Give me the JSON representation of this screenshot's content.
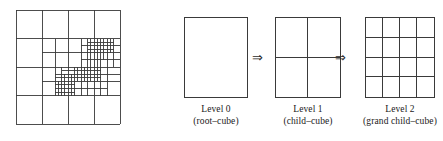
{
  "figure": {
    "name": "octree-refinement-figure",
    "background": "#ffffff",
    "line_color": "#3a3a3a",
    "text_color": "#1a1a1a"
  },
  "quadtree": {
    "name": "adaptive-quadtree-mesh",
    "label": "adaptively refined quadtree mesh",
    "domain": {
      "x0": 16,
      "y0": 10,
      "x1": 120,
      "y1": 124
    },
    "base_divisions": 4,
    "max_level": 4,
    "lines": [
      {
        "type": "h",
        "y": 10,
        "x0": 16,
        "x1": 120
      },
      {
        "type": "h",
        "y": 38.5,
        "x0": 16,
        "x1": 120
      },
      {
        "type": "h",
        "y": 67,
        "x0": 16,
        "x1": 120
      },
      {
        "type": "h",
        "y": 95.5,
        "x0": 16,
        "x1": 120
      },
      {
        "type": "h",
        "y": 124,
        "x0": 16,
        "x1": 120
      },
      {
        "type": "v",
        "x": 16,
        "y0": 10,
        "y1": 124
      },
      {
        "type": "v",
        "x": 42,
        "y0": 10,
        "y1": 124
      },
      {
        "type": "v",
        "x": 68,
        "y0": 10,
        "y1": 124
      },
      {
        "type": "v",
        "x": 94,
        "y0": 10,
        "y1": 124
      },
      {
        "type": "v",
        "x": 120,
        "y0": 10,
        "y1": 124
      },
      {
        "type": "h",
        "y": 52.75,
        "x0": 42,
        "x1": 120
      },
      {
        "type": "h",
        "y": 81.25,
        "x0": 42,
        "x1": 120
      },
      {
        "type": "v",
        "x": 55,
        "y0": 38.5,
        "y1": 95.5
      },
      {
        "type": "v",
        "x": 81,
        "y0": 38.5,
        "y1": 95.5
      },
      {
        "type": "v",
        "x": 107,
        "y0": 38.5,
        "y1": 95.5
      },
      {
        "type": "h",
        "y": 45.6,
        "x0": 81,
        "x1": 120
      },
      {
        "type": "h",
        "y": 59.9,
        "x0": 81,
        "x1": 120
      },
      {
        "type": "h",
        "y": 74.1,
        "x0": 55,
        "x1": 120
      },
      {
        "type": "h",
        "y": 88.4,
        "x0": 55,
        "x1": 107
      },
      {
        "type": "v",
        "x": 61.5,
        "y0": 67,
        "y1": 95.5
      },
      {
        "type": "v",
        "x": 74.5,
        "y0": 67,
        "y1": 95.5
      },
      {
        "type": "v",
        "x": 87.5,
        "y0": 38.5,
        "y1": 95.5
      },
      {
        "type": "v",
        "x": 100.5,
        "y0": 38.5,
        "y1": 95.5
      },
      {
        "type": "v",
        "x": 113.5,
        "y0": 38.5,
        "y1": 67
      },
      {
        "type": "h",
        "y": 42,
        "x0": 87.5,
        "x1": 113.5
      },
      {
        "type": "h",
        "y": 49.2,
        "x0": 87.5,
        "x1": 113.5
      },
      {
        "type": "h",
        "y": 70.6,
        "x0": 61.5,
        "x1": 100.5
      },
      {
        "type": "h",
        "y": 77.7,
        "x0": 55,
        "x1": 100.5
      },
      {
        "type": "h",
        "y": 84.9,
        "x0": 55,
        "x1": 74.5
      },
      {
        "type": "h",
        "y": 92,
        "x0": 55,
        "x1": 74.5
      },
      {
        "type": "v",
        "x": 58.2,
        "y0": 81.25,
        "y1": 95.5
      },
      {
        "type": "v",
        "x": 64.8,
        "y0": 74.1,
        "y1": 95.5
      },
      {
        "type": "v",
        "x": 71.2,
        "y0": 74.1,
        "y1": 95.5
      },
      {
        "type": "v",
        "x": 77.8,
        "y0": 67,
        "y1": 81.25
      },
      {
        "type": "v",
        "x": 84.2,
        "y0": 67,
        "y1": 81.25
      },
      {
        "type": "v",
        "x": 90.8,
        "y0": 38.5,
        "y1": 81.25
      },
      {
        "type": "v",
        "x": 97.2,
        "y0": 38.5,
        "y1": 81.25
      },
      {
        "type": "v",
        "x": 103.8,
        "y0": 38.5,
        "y1": 60
      },
      {
        "type": "v",
        "x": 110.2,
        "y0": 38.5,
        "y1": 53
      }
    ]
  },
  "refinement": {
    "name": "cube-refinement-sequence",
    "arrow_glyph": "⇒",
    "steps": [
      {
        "id": "level-0",
        "title": "Level 0",
        "subtitle": "(root–cube)",
        "rows": 1,
        "cols": 1,
        "box_width": 64,
        "box_height": 81
      },
      {
        "id": "level-1",
        "title": "Level 1",
        "subtitle": "(child–cube)",
        "rows": 2,
        "cols": 2,
        "box_width": 66,
        "box_height": 81
      },
      {
        "id": "level-2",
        "title": "Level 2",
        "subtitle": "(grand child–cube)",
        "rows": 4,
        "cols": 4,
        "box_width": 70,
        "box_height": 81
      }
    ]
  }
}
